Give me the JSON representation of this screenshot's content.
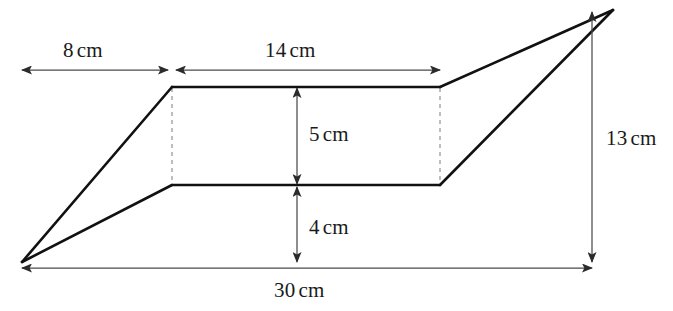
{
  "figure": {
    "kind": "geometry-diagram",
    "colors": {
      "background": "#ffffff",
      "outline": "#111111",
      "dimension_line": "#4a4a4a",
      "dashed_guide": "#9a9a9a",
      "text": "#1a1a1a"
    },
    "shape": {
      "outline_points": "22,262 172,87 613,10 440,185 22,262",
      "left_apex": "22,262",
      "right_apex": "613,10",
      "plateau_top_left": "172,87",
      "plateau_top_right": "440,87",
      "plateau_bottom_left": "172,185",
      "plateau_bottom_right": "440,185"
    },
    "dimensions": [
      {
        "id": "top-left-span",
        "value": "8",
        "unit": "cm",
        "orientation": "horizontal",
        "from": "22,70",
        "to": "168,70",
        "label_x": 63,
        "label_y": 40
      },
      {
        "id": "top-plateau-span",
        "value": "14",
        "unit": "cm",
        "orientation": "horizontal",
        "from": "176,70",
        "to": "440,70",
        "label_x": 265,
        "label_y": 40
      },
      {
        "id": "plateau-height",
        "value": "5",
        "unit": "cm",
        "orientation": "vertical",
        "from": "297,88",
        "to": "297,184",
        "label_x": 309,
        "label_y": 124
      },
      {
        "id": "lower-height",
        "value": "4",
        "unit": "cm",
        "orientation": "vertical",
        "from": "297,187",
        "to": "297,262",
        "label_x": 309,
        "label_y": 217
      },
      {
        "id": "total-height",
        "value": "13",
        "unit": "cm",
        "orientation": "vertical",
        "from": "592,12",
        "to": "592,262",
        "label_x": 606,
        "label_y": 128
      },
      {
        "id": "total-width",
        "value": "30",
        "unit": "cm",
        "orientation": "horizontal",
        "from": "22,268",
        "to": "592,268",
        "label_x": 274,
        "label_y": 280
      }
    ]
  }
}
